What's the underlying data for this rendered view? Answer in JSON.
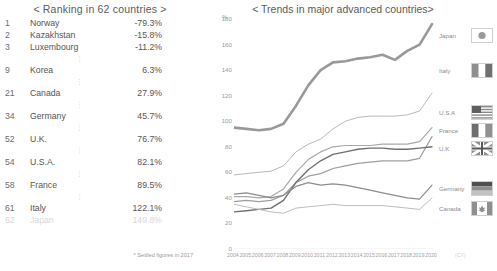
{
  "left_panel": {
    "title": "< Ranking in 62 countries >",
    "columns": [
      "rank",
      "country",
      "value"
    ],
    "rows": [
      {
        "rank": "1",
        "country": "Norway",
        "value": "-79.3%",
        "faded": false
      },
      {
        "rank": "2",
        "country": "Kazakhstan",
        "value": "-15.8%",
        "faded": false
      },
      {
        "rank": "3",
        "country": "Luxembourg",
        "value": "-11.2%",
        "faded": false
      },
      {
        "rank": "9",
        "country": "Korea",
        "value": "6.3%",
        "faded": false
      },
      {
        "rank": "21",
        "country": "Canada",
        "value": "27.9%",
        "faded": false
      },
      {
        "rank": "34",
        "country": "Germany",
        "value": "45.7%",
        "faded": false
      },
      {
        "rank": "52",
        "country": "U.K.",
        "value": "76.7%",
        "faded": false
      },
      {
        "rank": "54",
        "country": "U.S.A.",
        "value": "82.1%",
        "faded": false
      },
      {
        "rank": "58",
        "country": "France",
        "value": "89.5%",
        "faded": false
      },
      {
        "rank": "61",
        "country": "Italy",
        "value": "122.1%",
        "faded": false
      },
      {
        "rank": "62",
        "country": "Japan",
        "value": "149.8%",
        "faded": true
      }
    ],
    "footnote": "* Settled figures in 2017"
  },
  "chart_data": {
    "type": "line",
    "title": "< Trends in major advanced countries>",
    "xlabel": "(CY)",
    "ylabel": "%",
    "ylim": [
      0,
      180
    ],
    "yticks": [
      0,
      20,
      40,
      60,
      80,
      100,
      120,
      140,
      160,
      180
    ],
    "grid": false,
    "legend_position": "right-end-labels",
    "x": [
      "2004",
      "2005",
      "2006",
      "2007",
      "2008",
      "2009",
      "2010",
      "2011",
      "2012",
      "2013",
      "2014",
      "2015",
      "2016",
      "2017",
      "2018",
      "2019",
      "2020"
    ],
    "series": [
      {
        "name": "Japan",
        "color": "#999999",
        "width": 2.6,
        "values": [
          95,
          94,
          93,
          94,
          98,
          112,
          128,
          140,
          146,
          147,
          149,
          150,
          152,
          148,
          155,
          160,
          176
        ]
      },
      {
        "name": "Italy",
        "color": "#b9b9b9",
        "width": 1.0,
        "values": [
          58,
          59,
          60,
          61,
          65,
          76,
          82,
          86,
          94,
          100,
          103,
          104,
          104,
          104,
          105,
          108,
          122
        ]
      },
      {
        "name": "U.S.A",
        "color": "#a8a8a8",
        "width": 1.2,
        "values": [
          41,
          41,
          40,
          41,
          47,
          60,
          70,
          76,
          80,
          81,
          81,
          81,
          82,
          82,
          82,
          84,
          95
        ]
      },
      {
        "name": "France",
        "color": "#9e9e9e",
        "width": 1.2,
        "values": [
          37,
          38,
          37,
          38,
          42,
          52,
          57,
          59,
          63,
          65,
          67,
          68,
          69,
          69,
          69,
          71,
          88
        ]
      },
      {
        "name": "U.K",
        "color": "#6f6f6f",
        "width": 1.4,
        "values": [
          29,
          30,
          31,
          32,
          38,
          52,
          62,
          69,
          74,
          76,
          78,
          79,
          79,
          78,
          78,
          79,
          80
        ]
      },
      {
        "name": "Germany",
        "color": "#8c8c8c",
        "width": 1.2,
        "values": [
          43,
          44,
          42,
          40,
          42,
          49,
          52,
          50,
          51,
          50,
          48,
          46,
          44,
          42,
          40,
          39,
          50
        ]
      },
      {
        "name": "Canada",
        "color": "#bdbdbd",
        "width": 1.0,
        "values": [
          35,
          33,
          31,
          29,
          28,
          32,
          33,
          34,
          35,
          34,
          34,
          34,
          34,
          33,
          32,
          31,
          40
        ]
      }
    ],
    "end_labels": [
      {
        "name": "Japan",
        "y_px": 35,
        "flag": "japan-flag"
      },
      {
        "name": "Italy",
        "y_px": 70,
        "flag": "italy-flag"
      },
      {
        "name": "U.S.A",
        "y_px": 112,
        "flag": "usa-flag"
      },
      {
        "name": "France",
        "y_px": 130,
        "flag": "france-flag"
      },
      {
        "name": "U.K",
        "y_px": 148,
        "flag": "uk-flag"
      },
      {
        "name": "Germany",
        "y_px": 188,
        "flag": "germany-flag"
      },
      {
        "name": "Canada",
        "y_px": 208,
        "flag": "canada-flag"
      }
    ]
  }
}
